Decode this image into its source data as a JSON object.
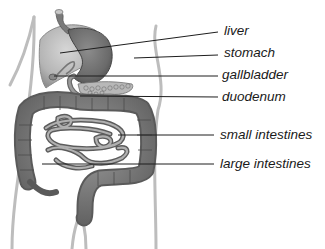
{
  "diagram": {
    "labels": [
      {
        "id": "liver",
        "text": "liver"
      },
      {
        "id": "stomach",
        "text": "stomach"
      },
      {
        "id": "gallbladder",
        "text": "gallbladder"
      },
      {
        "id": "duodenum",
        "text": "duodenum"
      },
      {
        "id": "small-intestines",
        "text": "small intestines"
      },
      {
        "id": "large-intestines",
        "text": "large intestines"
      }
    ]
  }
}
